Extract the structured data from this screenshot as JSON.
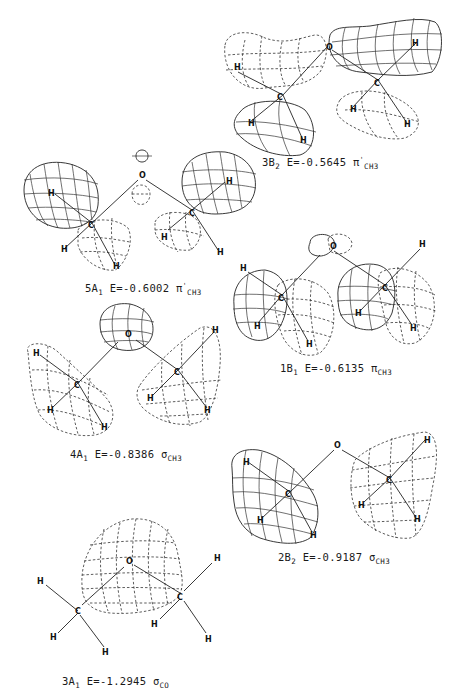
{
  "figure": {
    "molecule_atoms": {
      "oxygen": "O",
      "carbon": "C",
      "hydrogen": "H"
    },
    "orbitals": [
      {
        "id": "3B2",
        "sym_main": "3B",
        "sym_sub": "2",
        "energy_text": "E=-0.5645",
        "energy": -0.5645,
        "type_symbol": "π",
        "type_prime": "'",
        "type_sub": "CH3"
      },
      {
        "id": "5A1",
        "sym_main": "5A",
        "sym_sub": "1",
        "energy_text": "E=-0.6002",
        "energy": -0.6002,
        "type_symbol": "π",
        "type_prime": "'",
        "type_sub": "CH3"
      },
      {
        "id": "1B1",
        "sym_main": "1B",
        "sym_sub": "1",
        "energy_text": "E=-0.6135",
        "energy": -0.6135,
        "type_symbol": "π",
        "type_prime": "",
        "type_sub": "CH3"
      },
      {
        "id": "4A1",
        "sym_main": "4A",
        "sym_sub": "1",
        "energy_text": "E=-0.8386",
        "energy": -0.8386,
        "type_symbol": "σ",
        "type_prime": "",
        "type_sub": "CH3"
      },
      {
        "id": "2B2",
        "sym_main": "2B",
        "sym_sub": "2",
        "energy_text": "E=-0.9187",
        "energy": -0.9187,
        "type_symbol": "σ",
        "type_prime": "",
        "type_sub": "CH3"
      },
      {
        "id": "3A1",
        "sym_main": "3A",
        "sym_sub": "1",
        "energy_text": "E=-1.2945",
        "energy": -1.2945,
        "type_symbol": "σ",
        "type_prime": "",
        "type_sub": "CO"
      }
    ]
  }
}
